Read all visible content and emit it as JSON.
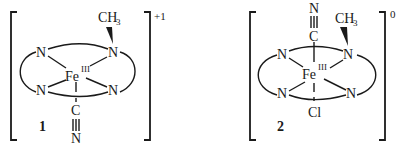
{
  "figure": {
    "background": "#ffffff",
    "ink_color": "#1a1a1a",
    "complexes": [
      {
        "id": "complex-1",
        "label": "1",
        "charge": "+1",
        "metal": "Fe",
        "oxidation_state": "III",
        "ring_atoms": [
          "N",
          "N",
          "N",
          "N"
        ],
        "methyl_group": {
          "main": "CH",
          "subscript": "3"
        },
        "axial_bottom": {
          "atom1": "C",
          "atom2": "N",
          "bond": "triple"
        },
        "axial_top": null
      },
      {
        "id": "complex-2",
        "label": "2",
        "charge": "0",
        "metal": "Fe",
        "oxidation_state": "III",
        "ring_atoms": [
          "N",
          "N",
          "N",
          "N"
        ],
        "methyl_group": {
          "main": "CH",
          "subscript": "3"
        },
        "axial_top": {
          "atom1": "C",
          "atom2": "N",
          "bond": "triple"
        },
        "axial_bottom": {
          "atom1": "Cl",
          "bond": "single"
        }
      }
    ]
  }
}
